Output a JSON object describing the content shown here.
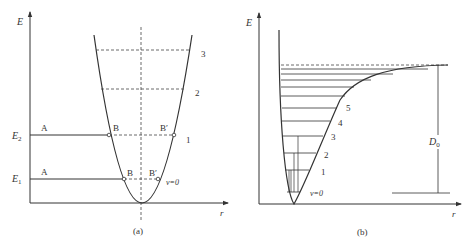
{
  "panel_a": {
    "caption": "(a)",
    "y_axis_label": "E",
    "x_axis_label": "r",
    "energy_labels": {
      "E2": "E",
      "E2_sub": "2",
      "E1": "E",
      "E1_sub": "1"
    },
    "point_labels": {
      "A_upper": "A",
      "B_upper": "B",
      "Bp_upper": "B′",
      "A_lower": "A",
      "B_lower": "B",
      "Bp_lower": "B′"
    },
    "level_labels": {
      "v3": "3",
      "v2": "2",
      "v1": "1",
      "v0": "ν=0"
    }
  },
  "panel_b": {
    "caption": "(b)",
    "y_axis_label": "E",
    "x_axis_label": "r",
    "dissociation_label": "D",
    "dissociation_sub": "0",
    "level_labels": {
      "v5": "5",
      "v4": "4",
      "v3": "3",
      "v2": "2",
      "v1": "1",
      "v0": "ν=0"
    }
  },
  "colors": {
    "line": "#333333",
    "dash": "#444444"
  }
}
